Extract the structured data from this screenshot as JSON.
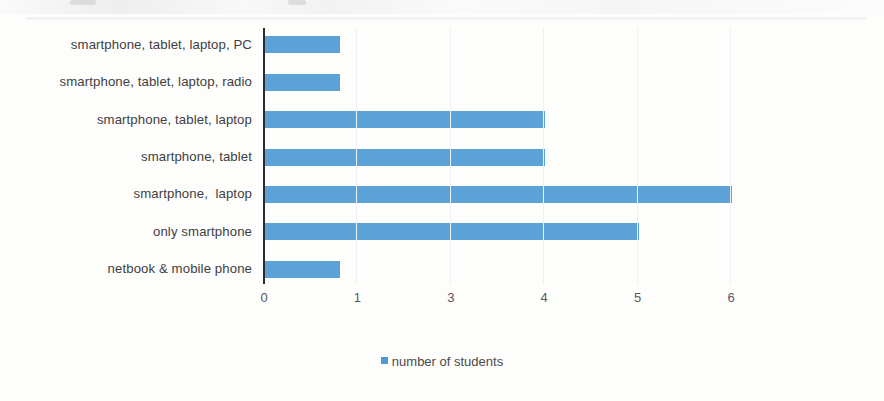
{
  "chart_data": {
    "type": "bar",
    "orientation": "horizontal",
    "title": "",
    "xlabel": "",
    "ylabel": "",
    "categories": [
      "smartphone, tablet, laptop, PC",
      "smartphone, tablet, laptop, radio",
      "smartphone, tablet, laptop",
      "smartphone, tablet",
      "smartphone,  laptop",
      "only smartphone",
      "netbook & mobile phone"
    ],
    "values": [
      0.8,
      0.8,
      3.0,
      3.0,
      5.0,
      4.0,
      0.8
    ],
    "series": [
      {
        "name": "number of students",
        "values": [
          0.8,
          0.8,
          3.0,
          3.0,
          5.0,
          4.0,
          0.8
        ],
        "color": "#4e9bd5"
      }
    ],
    "xlim": [
      0,
      6
    ],
    "x_tick_labels": [
      "0",
      "1",
      "3",
      "4",
      "5",
      "6"
    ],
    "x_tick_positions": [
      0,
      1,
      2,
      3,
      4,
      5
    ],
    "grid": false,
    "legend": {
      "position": "bottom",
      "entries": [
        {
          "label": "number of students",
          "color": "#4e9bd5"
        }
      ]
    }
  },
  "legend": {
    "label": "number of students"
  },
  "colors": {
    "bar": "#4e9bd5",
    "axis": "#2b2b2b",
    "label_text": "#404040",
    "tick_text": "#5a5a5a",
    "background": "#fdfdfc"
  }
}
